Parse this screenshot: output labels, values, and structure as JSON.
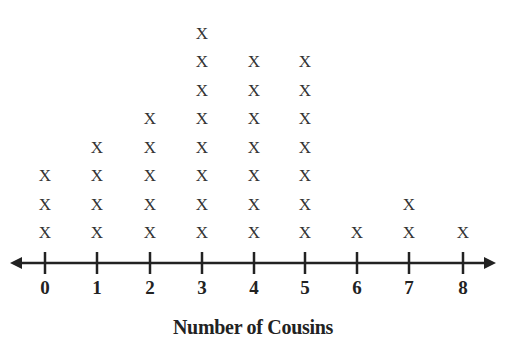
{
  "chart_data": {
    "type": "dot_plot",
    "title": "",
    "xlabel": "Number of Cousins",
    "ylabel": "",
    "marker": "X",
    "categories": [
      "0",
      "1",
      "2",
      "3",
      "4",
      "5",
      "6",
      "7",
      "8"
    ],
    "values": [
      3,
      4,
      5,
      8,
      7,
      7,
      1,
      2,
      1
    ],
    "xlim": [
      0,
      8
    ],
    "grid": false,
    "legend": null
  },
  "axis": {
    "title": "Number of Cousins",
    "tick_labels": [
      "0",
      "1",
      "2",
      "3",
      "4",
      "5",
      "6",
      "7",
      "8"
    ]
  }
}
